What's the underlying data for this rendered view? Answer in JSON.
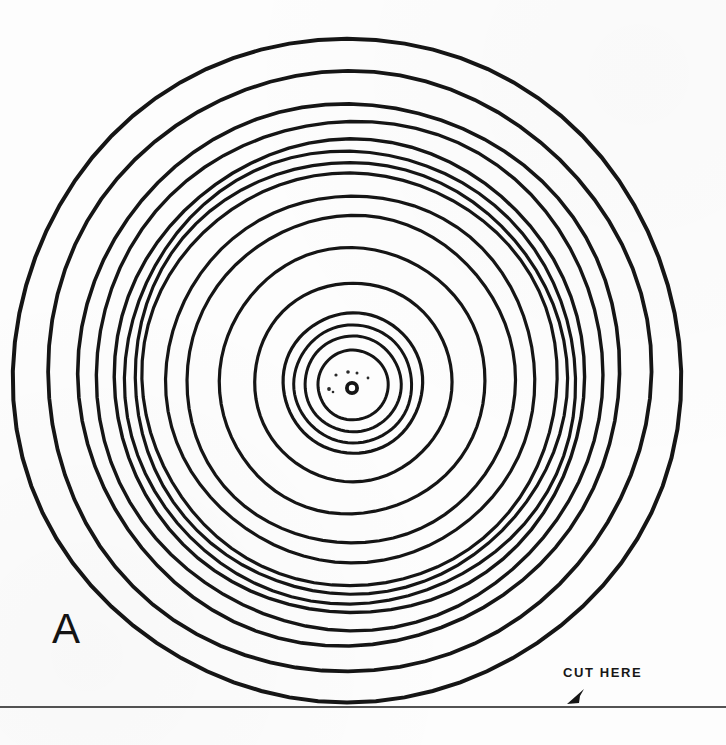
{
  "page": {
    "width": 726,
    "height": 745,
    "background_color": "#fdfdfd",
    "ink_color": "#151515"
  },
  "labels": {
    "panel_letter": "A",
    "cut_caption": "CUT HERE"
  },
  "chart_data": {
    "type": "line",
    "title": "A",
    "subtitle": "",
    "xlabel": "",
    "ylabel": "",
    "annotations": [
      {
        "text": "A",
        "x": 72,
        "y": 645,
        "role": "panel-letter"
      },
      {
        "text": "CUT HERE",
        "x": 600,
        "y": 673,
        "role": "cut-instruction"
      }
    ],
    "grid": false,
    "legend": null,
    "center": {
      "x": 347,
      "y": 371
    },
    "units": "pixels",
    "series": [
      {
        "name": "concentric-rings",
        "description": "Hand-drawn concentric circles, outermost to innermost",
        "values": [
          333,
          301,
          271,
          254,
          236,
          226,
          216,
          207,
          184,
          164,
          133,
          99,
          70,
          59,
          48,
          35
        ]
      }
    ],
    "rings": [
      {
        "index": 1,
        "radius": 333,
        "cx": 347,
        "cy": 371,
        "stroke_width": 4.0
      },
      {
        "index": 2,
        "radius": 301,
        "cx": 348,
        "cy": 372,
        "stroke_width": 3.8
      },
      {
        "index": 3,
        "radius": 271,
        "cx": 349,
        "cy": 374,
        "stroke_width": 3.6
      },
      {
        "index": 4,
        "radius": 254,
        "cx": 350,
        "cy": 375,
        "stroke_width": 3.4
      },
      {
        "index": 5,
        "radius": 236,
        "cx": 350,
        "cy": 377,
        "stroke_width": 3.4
      },
      {
        "index": 6,
        "radius": 226,
        "cx": 350,
        "cy": 378,
        "stroke_width": 3.2
      },
      {
        "index": 7,
        "radius": 216,
        "cx": 350,
        "cy": 378,
        "stroke_width": 3.2
      },
      {
        "index": 8,
        "radius": 207,
        "cx": 350,
        "cy": 379,
        "stroke_width": 3.2
      },
      {
        "index": 9,
        "radius": 184,
        "cx": 351,
        "cy": 379,
        "stroke_width": 3.2
      },
      {
        "index": 10,
        "radius": 164,
        "cx": 351,
        "cy": 380,
        "stroke_width": 3.2
      },
      {
        "index": 11,
        "radius": 133,
        "cx": 352,
        "cy": 381,
        "stroke_width": 3.2
      },
      {
        "index": 12,
        "radius": 99,
        "cx": 353,
        "cy": 382,
        "stroke_width": 3.2
      },
      {
        "index": 13,
        "radius": 70,
        "cx": 353,
        "cy": 383,
        "stroke_width": 3.2
      },
      {
        "index": 14,
        "radius": 59,
        "cx": 353,
        "cy": 384,
        "stroke_width": 3.0
      },
      {
        "index": 15,
        "radius": 48,
        "cx": 353,
        "cy": 384,
        "stroke_width": 3.0
      },
      {
        "index": 16,
        "radius": 35,
        "cx": 353,
        "cy": 385,
        "stroke_width": 3.0
      }
    ],
    "center_mark": {
      "type": "ring-hole",
      "cx": 352,
      "cy": 388,
      "outer_radius": 7,
      "inner_radius": 3.2
    },
    "specks": [
      {
        "cx": 336,
        "cy": 375,
        "r": 1.6
      },
      {
        "cx": 348,
        "cy": 372,
        "r": 1.8
      },
      {
        "cx": 357,
        "cy": 373,
        "r": 1.5
      },
      {
        "cx": 368,
        "cy": 378,
        "r": 1.4
      },
      {
        "cx": 329,
        "cy": 389,
        "r": 1.9
      },
      {
        "cx": 333,
        "cy": 392,
        "r": 1.3
      }
    ],
    "cut_line": {
      "y": 707,
      "x_start": 0,
      "x_end": 726,
      "stroke_width": 1.6
    },
    "cut_arrow": {
      "tip_x": 567,
      "tip_y": 704,
      "tail_x": 583,
      "tail_y": 690
    }
  }
}
